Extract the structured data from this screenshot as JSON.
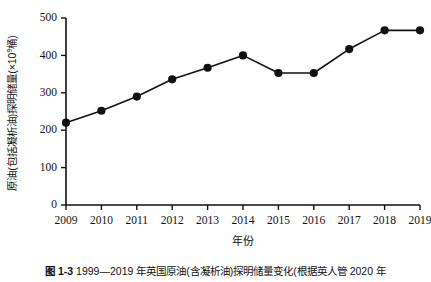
{
  "figure": {
    "caption_label": "图 1-3",
    "caption_text": "1999—2019 年英国原油(含凝析油)探明储量变化(根据英人管 2020 年"
  },
  "chart_data": {
    "type": "line",
    "title": "",
    "xlabel": "年份",
    "ylabel": "原油(包括凝析油)探明储量(×10⁹桶)",
    "ylabel_base": "原油(包括凝析油)探明储量(×10",
    "ylabel_exp": "9",
    "ylabel_tail": "桶)",
    "categories": [
      "2009",
      "2010",
      "2011",
      "2012",
      "2013",
      "2014",
      "2015",
      "2016",
      "2017",
      "2018",
      "2019"
    ],
    "x": [
      2009,
      2010,
      2011,
      2012,
      2013,
      2014,
      2015,
      2016,
      2017,
      2018,
      2019
    ],
    "values": [
      220,
      252,
      290,
      336,
      367,
      400,
      353,
      353,
      417,
      467,
      467
    ],
    "ylim": [
      0,
      500
    ],
    "yticks": [
      0,
      100,
      200,
      300,
      400,
      500
    ],
    "ytick_labels": [
      "0",
      "100",
      "200",
      "300",
      "400",
      "500"
    ],
    "xlim": [
      2009,
      2019
    ],
    "grid": false,
    "legend": null,
    "marker": "filled-circle",
    "line_color": "#111111",
    "marker_color": "#111111"
  }
}
